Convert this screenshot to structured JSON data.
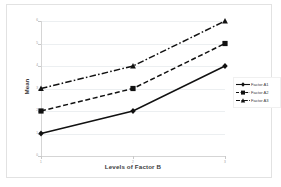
{
  "chart_data": {
    "type": "line",
    "title": "",
    "xlabel": "Levels of Factor B",
    "ylabel": "Mean",
    "x": [
      1,
      2,
      3
    ],
    "categories": [
      "1",
      "2",
      "3"
    ],
    "xtick_labels": [
      "1",
      "2",
      "3"
    ],
    "ytick_labels": [
      "0",
      "1",
      "2",
      "3",
      "4",
      "5",
      "6"
    ],
    "ylim": [
      0,
      6
    ],
    "xlim": [
      1,
      3
    ],
    "grid": true,
    "legend_position": "right",
    "series": [
      {
        "name": "Factor A1",
        "values": [
          1,
          2,
          4
        ],
        "line_style": "solid",
        "marker": "diamond",
        "color": "#111111"
      },
      {
        "name": "Factor A2",
        "values": [
          2,
          3,
          5
        ],
        "line_style": "dashed",
        "marker": "square",
        "color": "#111111"
      },
      {
        "name": "Factor A3",
        "values": [
          3,
          4,
          6
        ],
        "line_style": "dash-dot",
        "marker": "triangle",
        "color": "#111111"
      }
    ]
  },
  "legend": {
    "items": [
      {
        "label": "Factor A1"
      },
      {
        "label": "Factor A2"
      },
      {
        "label": "Factor A3"
      }
    ]
  },
  "axes": {
    "x_title": "Levels of Factor B",
    "y_title": "Mean"
  },
  "colors": {
    "series": "#111111",
    "grid": "#eceff1",
    "axis": "#d5d5d5",
    "tick_text": "#9a9a9a",
    "frame": "#e2e2e2",
    "background": "#ffffff"
  }
}
